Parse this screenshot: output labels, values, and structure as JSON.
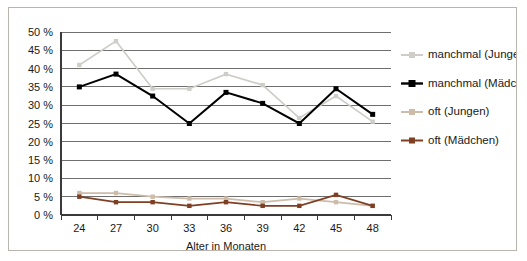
{
  "figure": {
    "border_color": "#b9b4ad",
    "background": "#ffffff"
  },
  "chart_data": {
    "type": "line",
    "title": "",
    "subtitle": "",
    "xlabel": "Alter in Monaten",
    "ylabel": "",
    "categories": [
      "24",
      "27",
      "30",
      "33",
      "36",
      "39",
      "42",
      "45",
      "48"
    ],
    "x": [
      24,
      27,
      30,
      33,
      36,
      39,
      42,
      45,
      48
    ],
    "ylim": [
      0,
      50
    ],
    "ytick_labels": [
      "0 %",
      "5 %",
      "10 %",
      "15 %",
      "20 %",
      "25 %",
      "30 %",
      "35 %",
      "40 %",
      "45 %",
      "50 %"
    ],
    "ytick_values": [
      0,
      5,
      10,
      15,
      20,
      25,
      30,
      35,
      40,
      45,
      50
    ],
    "grid": true,
    "grid_axis": "y",
    "legend_position": "right",
    "series": [
      {
        "name": "manchmal (Jungen)",
        "color": "#cfcdc8",
        "marker": "square",
        "values": [
          41.0,
          47.5,
          34.5,
          34.5,
          38.5,
          35.5,
          26.5,
          32.5,
          25.5
        ]
      },
      {
        "name": "manchmal (Mädchen)",
        "color": "#000000",
        "marker": "square",
        "values": [
          35.0,
          38.5,
          32.5,
          25.0,
          33.5,
          30.5,
          25.0,
          34.5,
          27.5
        ]
      },
      {
        "name": "oft (Jungen)",
        "color": "#cdbcaa",
        "marker": "square",
        "values": [
          6.0,
          6.0,
          5.0,
          4.5,
          4.5,
          3.5,
          4.5,
          3.5,
          2.5
        ]
      },
      {
        "name": "oft (Mädchen)",
        "color": "#7e3f23",
        "marker": "square",
        "values": [
          5.0,
          3.5,
          3.5,
          2.5,
          3.5,
          2.5,
          2.5,
          5.5,
          2.5
        ]
      }
    ]
  }
}
